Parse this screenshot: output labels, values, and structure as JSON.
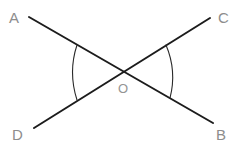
{
  "figure": {
    "width": 243,
    "height": 150,
    "background_color": "#ffffff",
    "line_color": "#1c1c1c",
    "arc_color": "#2a2a2a",
    "label_color": "#8d8d8d",
    "vertex_label_color": "#949494"
  },
  "labels": {
    "a": "A",
    "b": "B",
    "c": "C",
    "d": "D",
    "o": "O"
  },
  "watermark": {
    "text": ""
  },
  "chart_data": {
    "type": "diagram",
    "points": [
      {
        "name": "A",
        "x": 29,
        "y": 17,
        "label": "A",
        "label_x": 9,
        "label_y": 10
      },
      {
        "name": "C",
        "x": 210,
        "y": 18,
        "label": "C",
        "label_x": 218,
        "label_y": 10
      },
      {
        "name": "D",
        "x": 34,
        "y": 128,
        "label": "D",
        "label_x": 12,
        "label_y": 127
      },
      {
        "name": "B",
        "x": 213,
        "y": 123,
        "label": "B",
        "label_x": 216,
        "label_y": 127
      },
      {
        "name": "O",
        "x": 122,
        "y": 71,
        "label": "O",
        "label_x": 118,
        "label_y": 82
      }
    ],
    "segments": [
      {
        "name": "AB",
        "from": "A",
        "to": "B",
        "x1": 29,
        "y1": 17,
        "x2": 213,
        "y2": 123
      },
      {
        "name": "DC",
        "from": "D",
        "to": "C",
        "x1": 34,
        "y1": 128,
        "x2": 210,
        "y2": 18
      }
    ],
    "arcs": [
      {
        "name": "angle-AOD",
        "marks_angle": "AOD",
        "path": "M 77 45 Q 68 72 77 100"
      },
      {
        "name": "angle-BOC",
        "marks_angle": "COB",
        "path": "M 166 45 Q 177 71 170 98"
      }
    ]
  }
}
